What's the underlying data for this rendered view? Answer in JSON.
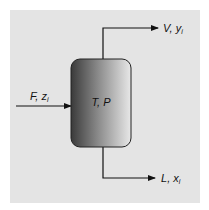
{
  "diagram": {
    "type": "flash-drum",
    "background_color": "#e4e4e4",
    "vessel": {
      "label": "T, P",
      "gradient_dark": "#3a3a3a",
      "gradient_light": "#e8e8e8"
    },
    "streams": {
      "feed": {
        "name": "F",
        "composition": "z",
        "subscript": "i",
        "sep": ", "
      },
      "vapor": {
        "name": "V",
        "composition": "y",
        "subscript": "i",
        "sep": ", "
      },
      "liquid": {
        "name": "L",
        "composition": "x",
        "subscript": "i",
        "sep": ", "
      }
    }
  }
}
